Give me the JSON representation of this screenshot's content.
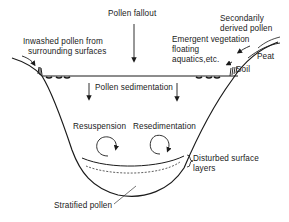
{
  "labels": {
    "pollen_fallout": "Pollen fallout",
    "inwashed_line1": "Inwashed pollen from",
    "inwashed_line2": "surrounding surfaces",
    "secondary_line1": "Secondarily",
    "secondary_line2": "derived pollen",
    "emergent_line1": "Emergent vegetation",
    "emergent_line2": "floating",
    "emergent_line3": "aquatics,etc.",
    "peat": "Peat",
    "soil": "Soil",
    "pollen_sedimentation": "Pollen sedimentation",
    "resuspension": "Resuspension",
    "resedimentation": "Resedimentation",
    "disturbed_line1": "Disturbed surface",
    "disturbed_line2": "layers",
    "stratified_pollen": "Stratified pollen"
  },
  "colors": {
    "line": "#1a1a1a",
    "background": "#ffffff"
  }
}
